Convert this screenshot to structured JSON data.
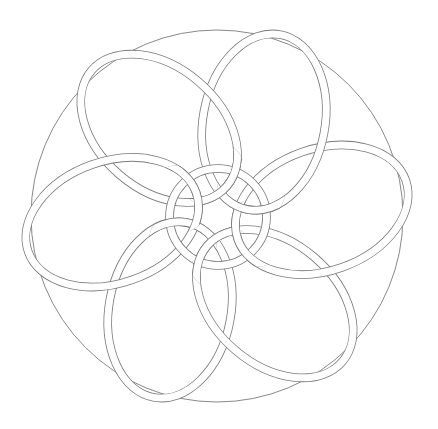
{
  "figure": {
    "background": "#ffffff",
    "stroke_color": "#7a7a7a",
    "outer_circle": {
      "cx": 217,
      "cy": 216,
      "r": 186
    },
    "center_ring": {
      "cx": 218,
      "cy": 217,
      "r_outer": 52,
      "r_inner": 45
    },
    "petals": {
      "count": 6,
      "distance_from_center": 105,
      "rx": 89,
      "ry": 61,
      "band_width": 7,
      "tilt_offset_deg": -16,
      "angles_deg": [
        116.6,
        56.6,
        -3.4,
        -63.4,
        -123.4,
        176.6
      ]
    }
  }
}
